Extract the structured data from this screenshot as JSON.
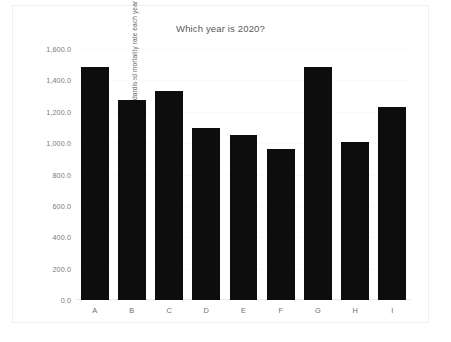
{
  "chart_data": {
    "type": "bar",
    "title": "Which year is 2020?",
    "xlabel": "",
    "ylabel": "ONS Age Standardised mortality rate each year",
    "categories": [
      "A",
      "B",
      "C",
      "D",
      "E",
      "F",
      "G",
      "H",
      "I"
    ],
    "values": [
      1485,
      1275,
      1332,
      1096,
      1052,
      962,
      1485,
      1007,
      1230
    ],
    "ylim": [
      0,
      1600
    ],
    "ytick_values": [
      0,
      200,
      400,
      600,
      800,
      1000,
      1200,
      1400,
      1600
    ],
    "ytick_labels": [
      "0.0",
      "200.0",
      "400.0",
      "600.0",
      "800.0",
      "1,000.0",
      "1,200.0",
      "1,400.0",
      "1,600.0"
    ],
    "grid": false,
    "legend": false,
    "legend_position": "none",
    "bar_color": "#0d0d0d",
    "background_color": "#ffffff",
    "text_color": "#6a6a6a"
  }
}
